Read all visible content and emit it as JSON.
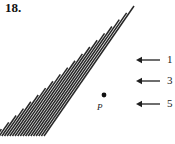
{
  "figure": {
    "problem_number": "18.",
    "point_label": "P",
    "point": {
      "x": 104,
      "y": 95
    },
    "line_color": "#262626",
    "arrow_color": "#4a4a4a",
    "text_color": "#1a1a1a",
    "background": "#ffffff",
    "apex": {
      "x": 134,
      "y": 6
    },
    "baseline_y": 136,
    "pencil": {
      "description": "family of parallel lines hatching a triangular region",
      "count": 20,
      "slope_dx": 36,
      "slope_dy": -52
    },
    "callouts": [
      {
        "label": "1",
        "y": 60,
        "arrow_tip_x": 136,
        "arrow_tail_x": 160,
        "number_x": 167
      },
      {
        "label": "3",
        "y": 81,
        "arrow_tip_x": 136,
        "arrow_tail_x": 160,
        "number_x": 167
      },
      {
        "label": "5",
        "y": 104,
        "arrow_tip_x": 136,
        "arrow_tail_x": 160,
        "number_x": 167
      }
    ]
  }
}
